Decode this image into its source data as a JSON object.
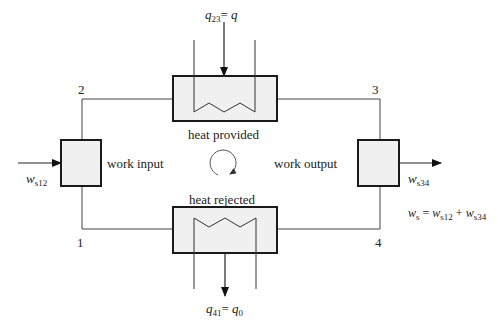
{
  "diagram": {
    "type": "thermodynamic-cycle",
    "states": {
      "s1": "1",
      "s2": "2",
      "s3": "3",
      "s4": "4"
    },
    "components": {
      "compressor": {
        "label": "work input"
      },
      "heater": {
        "label": "heat provided"
      },
      "turbine": {
        "label": "work output"
      },
      "cooler": {
        "label": "heat rejected"
      }
    },
    "flows": {
      "heat_in": {
        "symbol": "q",
        "subscript": "23",
        "eq": "= ",
        "rhs": "q"
      },
      "heat_out": {
        "symbol": "q",
        "subscript": "41",
        "eq": "= ",
        "rhs": "q",
        "rhs_subscript": "0"
      },
      "work_in": {
        "symbol": "w",
        "subscript": "s12"
      },
      "work_out": {
        "symbol": "w",
        "subscript": "s34"
      }
    },
    "net_work": {
      "lhs": "w",
      "lhs_sub": "s",
      "eq": " = ",
      "t1": "w",
      "t1_sub": "s12",
      "plus": " + ",
      "t2": "w",
      "t2_sub": "s34"
    },
    "colors": {
      "line": "#333333",
      "box_fill": "#f0f0f0",
      "box_border": "#1a1a1a"
    }
  }
}
